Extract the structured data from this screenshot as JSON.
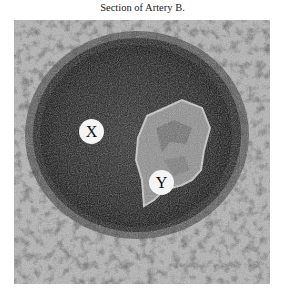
{
  "caption": "Section of Artery B.",
  "micrograph": {
    "description": "Histological cross-section of an artery",
    "labels": [
      {
        "id": "X",
        "text": "X"
      },
      {
        "id": "Y",
        "text": "Y"
      }
    ]
  }
}
